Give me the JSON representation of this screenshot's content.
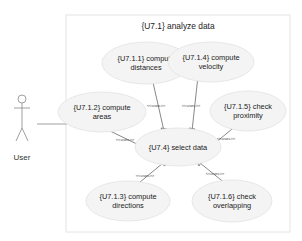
{
  "diagram": {
    "type": "uml-use-case",
    "system_boundary": {
      "title": "{U7.1} analyze data"
    },
    "actor": {
      "label": "User"
    },
    "use_cases": [
      {
        "id": "uc-7-1-1",
        "line1": "{U7.1.1} compute",
        "line2": "distances"
      },
      {
        "id": "uc-7-1-4",
        "line1": "{U7.1.4} compute",
        "line2": "velocity"
      },
      {
        "id": "uc-7-1-2",
        "line1": "{U7.1.2} compute",
        "line2": "areas"
      },
      {
        "id": "uc-7-1-5",
        "line1": "{U7.1.5} check",
        "line2": "proximity"
      },
      {
        "id": "uc-7-4",
        "line1": "{U7.4} select data"
      },
      {
        "id": "uc-7-1-3",
        "line1": "{U7.1.3} compute",
        "line2": "directions"
      },
      {
        "id": "uc-7-1-6",
        "line1": "{U7.1.6} check",
        "line2": "overlapping"
      }
    ],
    "relationships": [
      {
        "from": "{U7.1.1}",
        "to": "{U7.4}",
        "stereotype": "<<uses>>"
      },
      {
        "from": "{U7.1.4}",
        "to": "{U7.4}",
        "stereotype": "<<uses>>"
      },
      {
        "from": "{U7.1.2}",
        "to": "{U7.4}",
        "stereotype": "<<uses>>"
      },
      {
        "from": "{U7.1.5}",
        "to": "{U7.4}",
        "stereotype": "<<uses>>"
      },
      {
        "from": "{U7.1.3}",
        "to": "{U7.4}",
        "stereotype": "<<uses>>"
      },
      {
        "from": "{U7.1.6}",
        "to": "{U7.4}",
        "stereotype": "<<uses>>"
      }
    ],
    "colors": {
      "line": "#555555",
      "ellipse_fill": "#f4f4f4",
      "ellipse_stroke": "#e2e2e2",
      "boundary": "#e4e4e4"
    }
  }
}
